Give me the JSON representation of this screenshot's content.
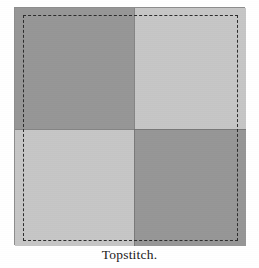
{
  "figure": {
    "caption": "Topstitch.",
    "type": "sewing-instruction-diagram",
    "background_color": "#ffffff"
  },
  "block": {
    "frame_color": "#9c9c9c",
    "frame_border_color": "#8d8d8d",
    "seam_color": "#6f6f6f",
    "patches": [
      {
        "position": "top-left",
        "shade": "dark",
        "color": "#969696"
      },
      {
        "position": "top-right",
        "shade": "light",
        "color": "#c6c6c6"
      },
      {
        "position": "bottom-left",
        "shade": "light",
        "color": "#c6c6c6"
      },
      {
        "position": "bottom-right",
        "shade": "dark",
        "color": "#969696"
      }
    ]
  },
  "topstitch": {
    "label": "topstitch-line",
    "style": "dashed",
    "color": "#2b2b2b"
  }
}
